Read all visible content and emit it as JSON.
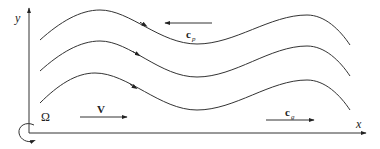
{
  "figure": {
    "axes": {
      "x_label": "x",
      "y_label": "y"
    },
    "rotation": {
      "symbol": "Ω"
    },
    "vectors": {
      "mean_flow": {
        "label": "V",
        "direction": "right"
      },
      "phase_velocity": {
        "label": "c",
        "subscript": "p",
        "direction": "left"
      },
      "group_velocity": {
        "label": "c",
        "subscript": "g",
        "direction": "right"
      }
    },
    "streamlines": [
      {
        "name": "streamline-1",
        "flow_arrow": "right"
      },
      {
        "name": "streamline-2",
        "flow_arrow": "right"
      },
      {
        "name": "streamline-3",
        "flow_arrow": "right"
      }
    ],
    "colors": {
      "line": "#333333",
      "background": "#ffffff"
    }
  }
}
